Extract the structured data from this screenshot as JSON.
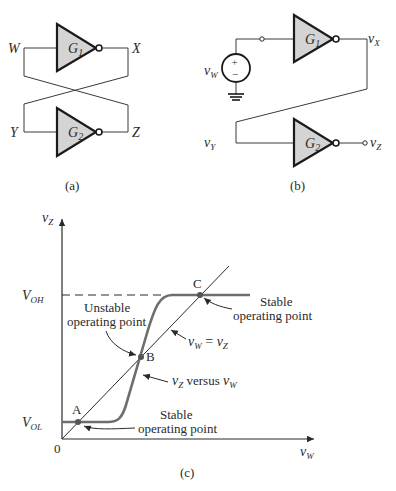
{
  "figure_a": {
    "caption": "(a)",
    "gate1": {
      "letter": "G",
      "sub": "1"
    },
    "gate2": {
      "letter": "G",
      "sub": "2"
    },
    "nodes": {
      "W": "W",
      "X": "X",
      "Y": "Y",
      "Z": "Z"
    }
  },
  "figure_b": {
    "caption": "(b)",
    "gate1": {
      "letter": "G",
      "sub": "1"
    },
    "gate2": {
      "letter": "G",
      "sub": "2"
    },
    "source": {
      "var": "v",
      "sub": "W",
      "plus": "+",
      "minus": "−"
    },
    "nodes": {
      "vX": {
        "var": "v",
        "sub": "X"
      },
      "vY": {
        "var": "v",
        "sub": "Y"
      },
      "vZ": {
        "var": "v",
        "sub": "Z"
      }
    }
  },
  "figure_c": {
    "caption": "(c)",
    "y_axis": {
      "var": "v",
      "sub": "Z"
    },
    "x_axis": {
      "var": "v",
      "sub": "W"
    },
    "origin": "0",
    "levels": {
      "VOH": {
        "letter": "V",
        "sub": "OH"
      },
      "VOL": {
        "letter": "V",
        "sub": "OL"
      }
    },
    "points": {
      "A": "A",
      "B": "B",
      "C": "C"
    },
    "annotations": {
      "unstable_line1": "Unstable",
      "unstable_line2": "operating point",
      "stable_c_line1": "Stable",
      "stable_c_line2": "operating point",
      "stable_a_line1": "Stable",
      "stable_a_line2": "operating point",
      "identity_lhs": "v",
      "identity_lhs_sub": "W",
      "identity_eq": " = ",
      "identity_rhs": "v",
      "identity_rhs_sub": "Z",
      "curve_var": "v",
      "curve_var_sub": "Z",
      "curve_versus": " versus ",
      "curve_var2": "v",
      "curve_var2_sub": "W"
    }
  }
}
